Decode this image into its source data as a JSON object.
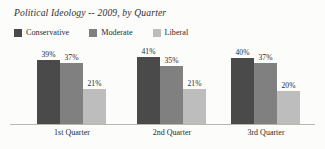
{
  "chart_data": {
    "type": "bar",
    "title": "Political Ideology -- 2009, by Quarter",
    "xlabel": "",
    "ylabel": "",
    "ylim": [
      0,
      45
    ],
    "grid": false,
    "legend_position": "top-left",
    "value_suffix": "%",
    "categories": [
      "1st Quarter",
      "2nd Quarter",
      "3rd Quarter"
    ],
    "series": [
      {
        "name": "Conservative",
        "color": "#4a4a4a",
        "values": [
          39,
          41,
          40
        ],
        "labels": [
          "39%",
          "41%",
          "40%"
        ]
      },
      {
        "name": "Moderate",
        "color": "#808080",
        "values": [
          37,
          35,
          37
        ],
        "labels": [
          "37%",
          "35%",
          "37%"
        ]
      },
      {
        "name": "Liberal",
        "color": "#bdbdbd",
        "values": [
          21,
          21,
          20
        ],
        "labels": [
          "21%",
          "21%",
          "20%"
        ]
      }
    ]
  },
  "legend": {
    "items": [
      {
        "label": "Conservative",
        "color": "#4a4a4a"
      },
      {
        "label": "Moderate",
        "color": "#808080"
      },
      {
        "label": "Liberal",
        "color": "#bdbdbd"
      }
    ]
  },
  "axis": {
    "baseline_color": "#b9b9b4"
  },
  "background_color": "#fcfcfa"
}
